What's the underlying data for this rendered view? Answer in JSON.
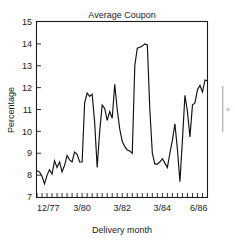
{
  "chart_data": {
    "type": "line",
    "title": "Average Coupon",
    "xlabel": "Delivery month",
    "ylabel": "Percentage",
    "ylim": [
      7,
      15
    ],
    "yticks": [
      7,
      8,
      9,
      10,
      11,
      12,
      13,
      14,
      15
    ],
    "ytick_labels": [
      "7",
      "8",
      "9",
      "10",
      "11",
      "12",
      "13",
      "14",
      "15"
    ],
    "xlim": [
      0,
      34
    ],
    "xtick_labels": [
      "12/77",
      "3/80",
      "3/82",
      "3/84",
      "6/86"
    ],
    "xtick_positions": [
      0,
      9,
      17,
      25,
      34
    ],
    "n_xticks": 35,
    "grid": false,
    "legend": false,
    "line_color": "#101010",
    "frame_color": "#1a1a1a",
    "background": "#ffffff",
    "series": [
      {
        "name": "Average Coupon",
        "x": [
          0,
          1,
          2,
          3,
          4,
          5,
          6,
          7,
          8,
          9,
          10,
          11,
          12,
          13,
          14,
          15,
          16,
          17,
          18,
          19,
          20,
          21,
          22,
          23,
          24,
          25,
          26,
          27,
          28,
          29,
          30,
          31,
          32,
          33,
          34,
          35,
          36,
          37,
          38,
          39,
          40,
          41,
          42,
          43,
          44,
          45,
          46,
          47,
          48,
          49,
          50,
          51,
          52,
          53,
          54,
          55,
          56,
          57,
          58,
          59,
          60,
          61,
          62,
          63,
          64,
          65,
          66,
          67,
          68
        ],
        "values": [
          8.2,
          8.15,
          7.95,
          7.6,
          8.0,
          8.25,
          8.05,
          8.65,
          8.35,
          8.6,
          8.15,
          8.45,
          8.9,
          8.7,
          8.6,
          9.05,
          8.95,
          8.6,
          8.6,
          11.3,
          11.75,
          11.6,
          11.7,
          10.4,
          8.35,
          10.0,
          11.2,
          11.05,
          10.5,
          10.9,
          10.6,
          12.15,
          11.0,
          10.1,
          9.55,
          9.3,
          9.15,
          9.1,
          9.0,
          13.0,
          13.8,
          13.85,
          13.9,
          14.0,
          13.95,
          11.0,
          9.0,
          8.5,
          8.5,
          8.6,
          8.75,
          8.55,
          8.35,
          9.0,
          9.6,
          10.35,
          9.2,
          7.7,
          9.6,
          11.65,
          10.9,
          9.75,
          11.2,
          11.3,
          11.9,
          12.1,
          11.8,
          12.35,
          12.3
        ]
      }
    ]
  },
  "annotations": {
    "edge_mark": "»"
  }
}
